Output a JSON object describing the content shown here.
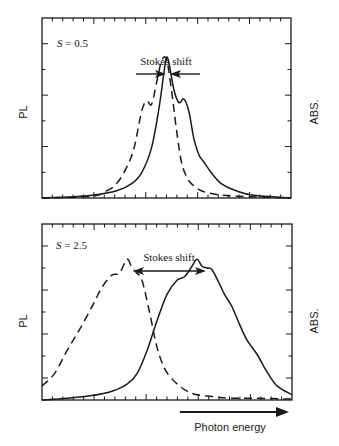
{
  "chart_data": [
    {
      "type": "line",
      "panel": "top",
      "title": "",
      "annotation_param": "S = 0.5",
      "annotation_shift": "Stokes shift",
      "ylabel_left": "PL",
      "ylabel_right": "ABS.",
      "xlabel": "Photon energy",
      "xlim": [
        0,
        1
      ],
      "ylim": [
        0,
        1
      ],
      "grid": false,
      "series": [
        {
          "name": "PL",
          "style": "solid",
          "x": [
            0.0,
            0.1,
            0.2,
            0.3,
            0.36,
            0.4,
            0.44,
            0.47,
            0.49,
            0.5,
            0.51,
            0.53,
            0.55,
            0.57,
            0.59,
            0.61,
            0.63,
            0.65,
            0.68,
            0.72,
            0.78,
            0.85,
            1.0
          ],
          "y": [
            0.0,
            0.005,
            0.015,
            0.04,
            0.08,
            0.14,
            0.28,
            0.5,
            0.7,
            0.78,
            0.75,
            0.6,
            0.53,
            0.55,
            0.48,
            0.33,
            0.24,
            0.2,
            0.14,
            0.08,
            0.04,
            0.015,
            0.0
          ]
        },
        {
          "name": "ABS",
          "style": "dashed",
          "x": [
            0.0,
            0.2,
            0.26,
            0.3,
            0.34,
            0.37,
            0.4,
            0.42,
            0.44,
            0.46,
            0.48,
            0.5,
            0.52,
            0.54,
            0.56,
            0.58,
            0.6,
            0.64,
            0.7,
            0.78,
            1.0
          ],
          "y": [
            0.0,
            0.01,
            0.04,
            0.08,
            0.17,
            0.28,
            0.48,
            0.54,
            0.52,
            0.64,
            0.76,
            0.77,
            0.6,
            0.38,
            0.2,
            0.12,
            0.08,
            0.04,
            0.02,
            0.01,
            0.0
          ]
        }
      ],
      "stokes_arrows": {
        "type": "inward",
        "left_x": [
          0.38,
          0.49
        ],
        "right_x": [
          0.51,
          0.6
        ],
        "y": 0.84
      }
    },
    {
      "type": "line",
      "panel": "bottom",
      "title": "",
      "annotation_param": "S = 2.5",
      "annotation_shift": "Stokes shift",
      "ylabel_left": "PL",
      "ylabel_right": "ABS.",
      "xlabel": "Photon energy",
      "xlim": [
        0,
        1
      ],
      "ylim": [
        0,
        1
      ],
      "grid": false,
      "series": [
        {
          "name": "PL",
          "style": "solid",
          "x": [
            0.0,
            0.1,
            0.2,
            0.28,
            0.34,
            0.38,
            0.42,
            0.46,
            0.5,
            0.54,
            0.57,
            0.6,
            0.62,
            0.64,
            0.66,
            0.68,
            0.71,
            0.73,
            0.76,
            0.79,
            0.82,
            0.86,
            0.9,
            0.94,
            1.0
          ],
          "y": [
            0.0,
            0.01,
            0.025,
            0.05,
            0.09,
            0.15,
            0.28,
            0.45,
            0.6,
            0.68,
            0.7,
            0.76,
            0.8,
            0.76,
            0.75,
            0.74,
            0.66,
            0.6,
            0.53,
            0.43,
            0.34,
            0.26,
            0.16,
            0.08,
            0.03
          ]
        },
        {
          "name": "ABS",
          "style": "dashed",
          "x": [
            0.0,
            0.05,
            0.1,
            0.15,
            0.2,
            0.24,
            0.28,
            0.31,
            0.34,
            0.36,
            0.38,
            0.4,
            0.43,
            0.46,
            0.49,
            0.52,
            0.55,
            0.58,
            0.62,
            0.68,
            0.75,
            0.85,
            1.0
          ],
          "y": [
            0.08,
            0.15,
            0.28,
            0.4,
            0.53,
            0.64,
            0.71,
            0.72,
            0.8,
            0.75,
            0.72,
            0.68,
            0.5,
            0.3,
            0.18,
            0.12,
            0.08,
            0.05,
            0.03,
            0.02,
            0.01,
            0.01,
            0.005
          ]
        }
      ],
      "stokes_arrows": {
        "type": "double",
        "x": [
          0.37,
          0.66
        ],
        "y": 0.88
      }
    }
  ],
  "panels": {
    "top": {
      "param_label": "S = 0.5",
      "shift_label": "Stokes shift",
      "left_axis_label": "PL",
      "right_axis_label": "ABS."
    },
    "bottom": {
      "param_label": "S = 2.5",
      "shift_label": "Stokes shift",
      "left_axis_label": "PL",
      "right_axis_label": "ABS."
    }
  },
  "xaxis_label": "Photon energy",
  "colors": {
    "line": "#1a1a1a",
    "background": "#ffffff"
  }
}
